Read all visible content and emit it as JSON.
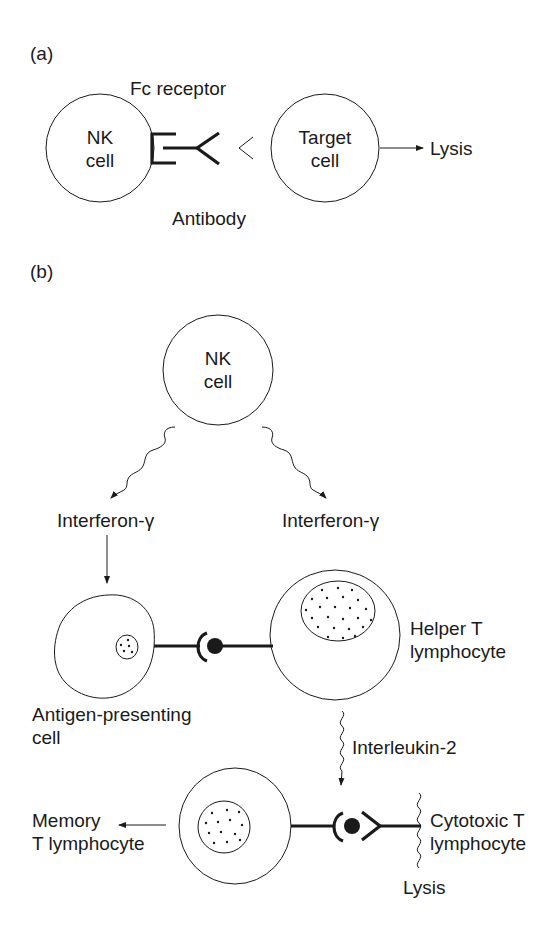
{
  "panel_a": {
    "label": "(a)",
    "nk_cell": {
      "line1": "NK",
      "line2": "cell"
    },
    "target_cell": {
      "line1": "Target",
      "line2": "cell"
    },
    "fc_receptor": "Fc receptor",
    "antibody": "Antibody",
    "lysis": "Lysis"
  },
  "panel_b": {
    "label": "(b)",
    "nk_cell": {
      "line1": "NK",
      "line2": "cell"
    },
    "interferon_left": "Interferon-γ",
    "interferon_right": "Interferon-γ",
    "apc": {
      "line1": "Antigen-presenting",
      "line2": "cell"
    },
    "helper_t": {
      "line1": "Helper T",
      "line2": "lymphocyte"
    },
    "interleukin": "Interleukin-2",
    "memory_t": {
      "line1": "Memory",
      "line2": "T lymphocyte"
    },
    "cytotoxic_t": {
      "line1": "Cytotoxic T",
      "line2": "lymphocyte"
    },
    "lysis": "Lysis"
  },
  "colors": {
    "stroke": "#1a1a1a",
    "background": "#ffffff"
  }
}
